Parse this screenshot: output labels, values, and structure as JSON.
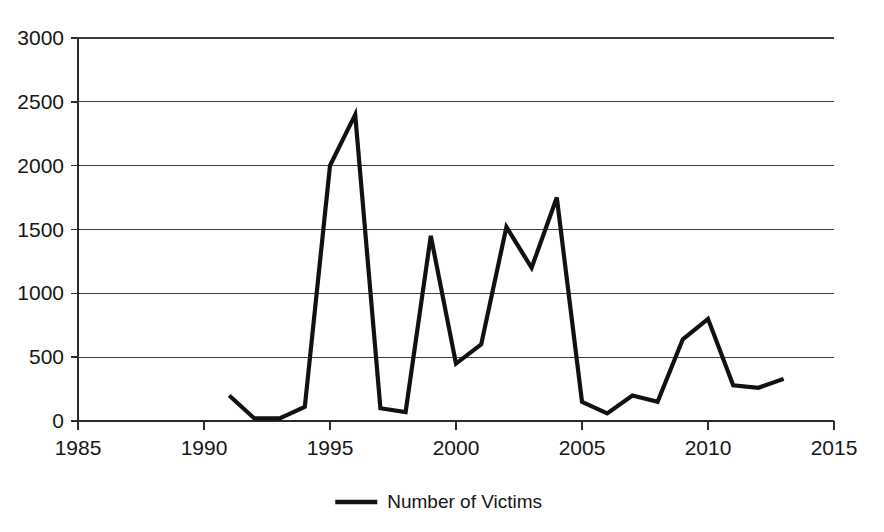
{
  "chart_data": {
    "type": "line",
    "title": "",
    "xlabel": "",
    "ylabel": "",
    "xlim": [
      1985,
      2015
    ],
    "ylim": [
      0,
      3000
    ],
    "grid": true,
    "legend_position": "bottom",
    "x_ticks": [
      1985,
      1990,
      1995,
      2000,
      2005,
      2010,
      2015
    ],
    "y_ticks": [
      0,
      500,
      1000,
      1500,
      2000,
      2500,
      3000
    ],
    "x_tick_labels": [
      "1985",
      "1990",
      "1995",
      "2000",
      "2005",
      "2010",
      "2015"
    ],
    "y_tick_labels": [
      "0",
      "500",
      "1000",
      "1500",
      "2000",
      "2500",
      "3000"
    ],
    "series": [
      {
        "name": "Number of Victims",
        "color": "#111111",
        "x": [
          1991,
          1992,
          1993,
          1994,
          1995,
          1996,
          1997,
          1998,
          1999,
          2000,
          2001,
          2002,
          2003,
          2004,
          2005,
          2006,
          2007,
          2008,
          2009,
          2010,
          2011,
          2012,
          2013
        ],
        "values": [
          200,
          20,
          20,
          110,
          2000,
          2400,
          100,
          70,
          1450,
          450,
          600,
          1520,
          1200,
          1750,
          150,
          60,
          200,
          150,
          640,
          800,
          280,
          260,
          330
        ]
      }
    ]
  },
  "legend": {
    "entries": [
      {
        "label": "Number of Victims",
        "color": "#111111"
      }
    ]
  }
}
